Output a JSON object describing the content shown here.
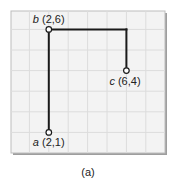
{
  "diagram": {
    "grid": {
      "left": 11,
      "top": 11,
      "right": 165,
      "bottom": 153,
      "cell": 19.5,
      "background": "#f3f3f3",
      "line_color": "#dcdcdc",
      "border_color": "#bdbdbd",
      "shadow_color": "#9e9e9e"
    },
    "origin_px": {
      "x": 10,
      "y": 153
    },
    "unit_px": {
      "x": 19.4,
      "y": 20.6
    },
    "line_color": "#1a1a1a",
    "points": [
      {
        "id": "a",
        "name": "a",
        "coords": "(2,1)",
        "x": 2,
        "y": 1,
        "label_dx": -16,
        "label_dy": 14
      },
      {
        "id": "b",
        "name": "b",
        "coords": "(2,6)",
        "x": 2,
        "y": 6,
        "label_dx": -16,
        "label_dy": -6
      },
      {
        "id": "c",
        "name": "c",
        "coords": "(6,4)",
        "x": 6,
        "y": 4,
        "label_dx": -17,
        "label_dy": 14
      }
    ],
    "segments": [
      {
        "from": "a",
        "to": "b"
      },
      {
        "from": "b",
        "to": "corner"
      },
      {
        "from": "corner",
        "to": "c"
      }
    ],
    "corner": {
      "x": 6,
      "y": 6
    },
    "caption": "(a)"
  }
}
